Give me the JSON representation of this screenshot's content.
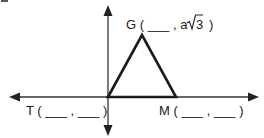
{
  "diagram": {
    "type": "coordinate-plane-triangle",
    "colors": {
      "axis": "#333333",
      "triangle": "#1a1a1a",
      "text": "#222222"
    },
    "points": {
      "G": {
        "name": "G",
        "open": "(",
        "x_blank": "___",
        "sep": ",",
        "y_prefix": "a",
        "y_radical": "3",
        "close": ")"
      },
      "T": {
        "name": "T",
        "open": "(",
        "x_blank": "___",
        "sep": ",",
        "y_blank": "___",
        "close": ")"
      },
      "M": {
        "name": "M",
        "open": "(",
        "x_blank": "___",
        "sep": ",",
        "y_blank": "___",
        "close": ")"
      }
    },
    "labels": {
      "G": "G ( ___ , a",
      "G_radicand": "3",
      "G_close": ")",
      "T": "T ( ___ , ___ )",
      "M": "M ( ___ , ___ )"
    }
  }
}
